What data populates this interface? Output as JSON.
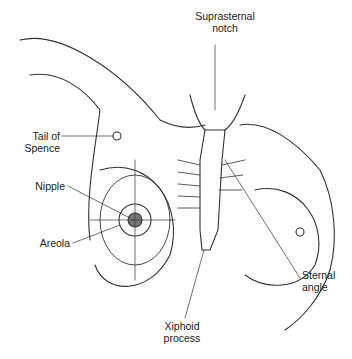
{
  "diagram": {
    "labels": {
      "suprasternal_notch": [
        "Suprasternal",
        "notch"
      ],
      "tail_of_spence": [
        "Tail of",
        "Spence"
      ],
      "nipple": "Nipple",
      "areola": "Areola",
      "sternal_angle": [
        "Sternal",
        "angle"
      ],
      "xiphoid_process": [
        "Xiphoid",
        "process"
      ]
    }
  }
}
